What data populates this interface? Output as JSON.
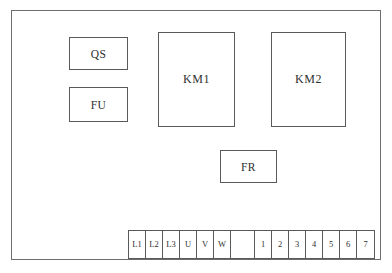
{
  "diagram": {
    "background_color": "#ffffff",
    "line_color": "#5a5a5a",
    "frame": {
      "name": "control-panel-frame"
    },
    "components": [
      {
        "id": "qs",
        "label": "QS",
        "name": "component-box-qs"
      },
      {
        "id": "fu",
        "label": "FU",
        "name": "component-box-fu"
      },
      {
        "id": "km1",
        "label": "KM1",
        "name": "component-box-km1"
      },
      {
        "id": "km2",
        "label": "KM2",
        "name": "component-box-km2"
      },
      {
        "id": "fr",
        "label": "FR",
        "name": "component-box-fr"
      }
    ],
    "terminal_strip": {
      "name": "terminal-strip",
      "cells": [
        {
          "label": "L1",
          "width": "normal"
        },
        {
          "label": "L2",
          "width": "normal"
        },
        {
          "label": "L3",
          "width": "normal"
        },
        {
          "label": "U",
          "width": "normal"
        },
        {
          "label": "V",
          "width": "normal"
        },
        {
          "label": "W",
          "width": "normal"
        },
        {
          "label": "",
          "width": "wide"
        },
        {
          "label": "1",
          "width": "normal"
        },
        {
          "label": "2",
          "width": "normal"
        },
        {
          "label": "3",
          "width": "normal"
        },
        {
          "label": "4",
          "width": "normal"
        },
        {
          "label": "5",
          "width": "normal"
        },
        {
          "label": "6",
          "width": "normal"
        },
        {
          "label": "7",
          "width": "normal"
        }
      ]
    }
  }
}
